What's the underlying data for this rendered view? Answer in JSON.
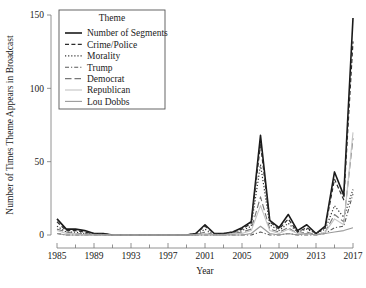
{
  "chart_data": {
    "type": "line",
    "title": "",
    "xlabel": "Year",
    "ylabel": "Number of Times Theme Appears in Broadcast",
    "legend_title": "Theme",
    "legend_position": "top-left",
    "grid": false,
    "xlim": [
      1985,
      2017
    ],
    "ylim": [
      0,
      150
    ],
    "yticks": [
      0,
      50,
      100,
      150
    ],
    "ytick_labels": [
      "0",
      "50",
      "100",
      "150"
    ],
    "xticks": [
      1985,
      1989,
      1993,
      1997,
      2001,
      2005,
      2009,
      2013,
      2017
    ],
    "xtick_labels": [
      "1985",
      "1989",
      "1993",
      "1997",
      "2001",
      "2005",
      "2009",
      "2013",
      "2017"
    ],
    "x_minor_ticks": [
      1987,
      1991,
      1995,
      1999,
      2003,
      2007,
      2011,
      2015
    ],
    "x": [
      1985,
      1986,
      1987,
      1988,
      1989,
      1990,
      1991,
      1992,
      1993,
      1994,
      1995,
      1996,
      1997,
      1998,
      1999,
      2000,
      2001,
      2002,
      2003,
      2004,
      2005,
      2006,
      2007,
      2008,
      2009,
      2010,
      2011,
      2012,
      2013,
      2014,
      2015,
      2016,
      2017
    ],
    "series": [
      {
        "name": "Number of Segments",
        "style": "solid",
        "color": "#1a1a1a",
        "width": 1.6,
        "values": [
          11,
          4,
          4,
          3,
          1,
          1,
          0,
          0,
          0,
          0,
          0,
          0,
          0,
          0,
          0,
          1,
          7,
          1,
          1,
          2,
          5,
          9,
          68,
          10,
          5,
          14,
          3,
          7,
          1,
          6,
          43,
          27,
          148
        ]
      },
      {
        "name": "Crime/Police",
        "style": "dashed",
        "color": "#2b2b2b",
        "width": 1.2,
        "values": [
          9,
          3,
          3,
          2,
          1,
          1,
          0,
          0,
          0,
          0,
          0,
          0,
          0,
          0,
          0,
          1,
          6,
          1,
          1,
          2,
          4,
          8,
          62,
          9,
          4,
          11,
          2,
          5,
          1,
          5,
          38,
          24,
          132
        ]
      },
      {
        "name": "Morality",
        "style": "dotted",
        "color": "#333333",
        "width": 1.2,
        "values": [
          6,
          2,
          2,
          1,
          1,
          0,
          0,
          0,
          0,
          0,
          0,
          0,
          0,
          0,
          0,
          0,
          4,
          0,
          1,
          1,
          3,
          6,
          48,
          7,
          3,
          8,
          2,
          4,
          1,
          4,
          20,
          12,
          31
        ]
      },
      {
        "name": "Trump",
        "style": "dashdot",
        "color": "#5a5a5a",
        "width": 1.1,
        "values": [
          1,
          0,
          0,
          0,
          0,
          0,
          0,
          0,
          0,
          0,
          0,
          0,
          0,
          0,
          0,
          0,
          0,
          0,
          0,
          0,
          0,
          0,
          2,
          0,
          0,
          1,
          0,
          0,
          0,
          1,
          5,
          6,
          28
        ]
      },
      {
        "name": "Democrat",
        "style": "longdash",
        "color": "#777777",
        "width": 1.1,
        "values": [
          4,
          2,
          1,
          1,
          0,
          0,
          0,
          0,
          0,
          0,
          0,
          0,
          0,
          0,
          0,
          0,
          2,
          0,
          0,
          1,
          2,
          4,
          26,
          4,
          2,
          5,
          1,
          2,
          0,
          2,
          14,
          9,
          66
        ]
      },
      {
        "name": "Republican",
        "style": "solid-light",
        "color": "#c4c4c4",
        "width": 1.1,
        "values": [
          3,
          1,
          1,
          0,
          0,
          0,
          0,
          0,
          0,
          0,
          0,
          0,
          0,
          0,
          0,
          0,
          1,
          0,
          0,
          1,
          1,
          3,
          20,
          3,
          1,
          4,
          1,
          1,
          0,
          2,
          11,
          7,
          70
        ]
      },
      {
        "name": "Lou Dobbs",
        "style": "solid-mid",
        "color": "#9a9a9a",
        "width": 1.1,
        "values": [
          1,
          0,
          0,
          0,
          0,
          0,
          0,
          0,
          0,
          0,
          0,
          0,
          0,
          0,
          0,
          0,
          0,
          0,
          0,
          0,
          0,
          1,
          6,
          1,
          0,
          1,
          0,
          1,
          0,
          1,
          2,
          3,
          5
        ]
      }
    ]
  }
}
